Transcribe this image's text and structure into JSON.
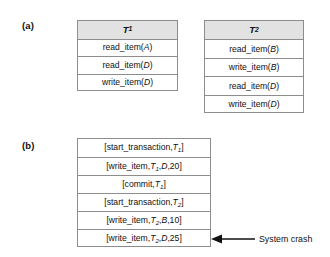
{
  "figure": {
    "panels": [
      {
        "id": "a",
        "label": "(a)"
      },
      {
        "id": "b",
        "label": "(b)"
      }
    ]
  },
  "panel_a": {
    "transactions": [
      {
        "header": "T",
        "header_sub": "1",
        "operations": [
          {
            "op": "read_item",
            "arg": "A",
            "text": "read_item(A)"
          },
          {
            "op": "read_item",
            "arg": "D",
            "text": "read_item(D)"
          },
          {
            "op": "write_item",
            "arg": "D",
            "text": "write_item(D)"
          }
        ]
      },
      {
        "header": "T",
        "header_sub": "2",
        "operations": [
          {
            "op": "read_item",
            "arg": "B",
            "text": "read_item(B)"
          },
          {
            "op": "write_item",
            "arg": "B",
            "text": "write_item(B)"
          },
          {
            "op": "read_item",
            "arg": "D",
            "text": "read_item(D)"
          },
          {
            "op": "write_item",
            "arg": "D",
            "text": "write_item(D)"
          }
        ]
      }
    ]
  },
  "panel_b": {
    "log_entries": [
      {
        "type": "start_transaction",
        "txn": "T",
        "txn_sub": "1",
        "item": null,
        "value": null,
        "text": "[start_transaction,T1]"
      },
      {
        "type": "write_item",
        "txn": "T",
        "txn_sub": "1",
        "item": "D",
        "value": "20",
        "text": "[write_item,T1,D,20]"
      },
      {
        "type": "commit",
        "txn": "T",
        "txn_sub": "1",
        "item": null,
        "value": null,
        "text": "[commit,T1]"
      },
      {
        "type": "start_transaction",
        "txn": "T",
        "txn_sub": "2",
        "item": null,
        "value": null,
        "text": "[start_transaction,T2]"
      },
      {
        "type": "write_item",
        "txn": "T",
        "txn_sub": "2",
        "item": "B",
        "value": "10",
        "text": "[write_item,T2,B,10]"
      },
      {
        "type": "write_item",
        "txn": "T",
        "txn_sub": "2",
        "item": "D",
        "value": "25",
        "text": "[write_item,T2,D,25]"
      }
    ],
    "annotation": {
      "label": "System crash",
      "points_to_entry_index": 5
    }
  },
  "colors": {
    "header_fill": "#e2e2e2",
    "border": "#8d8d8d",
    "text": "#111111",
    "background": "#ffffff"
  }
}
